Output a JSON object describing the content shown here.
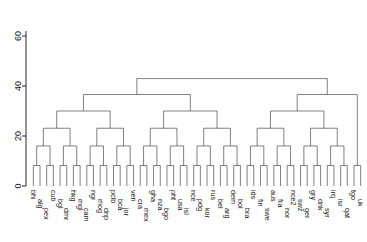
{
  "chart_data": {
    "type": "dendrogram",
    "title": "",
    "xlabel": "",
    "ylabel": "",
    "ylim": [
      0,
      68
    ],
    "yticks": [
      0,
      20,
      40,
      60
    ],
    "ytick_labels": [
      "0",
      "20",
      "40",
      "60"
    ],
    "grid": false,
    "legend": false,
    "orientation": "vertical",
    "leaf_label_rotation": 90,
    "n_leaves": 50,
    "leaves": [
      "bhi",
      "alg",
      "pex",
      "cub",
      "bgl",
      "dmr",
      "hkg",
      "mgl",
      "cam",
      "ngr",
      "mog",
      "dnp",
      "pclb",
      "bca",
      "jor",
      "ven",
      "cra",
      "mex",
      "gha",
      "nza",
      "bgo",
      "pht",
      "usa",
      "isl",
      "nce",
      "pdg",
      "kor",
      "rus",
      "bel",
      "arg",
      "dem",
      "bol",
      "bra",
      "ids",
      "fin",
      "swe",
      "aus",
      "fra",
      "nor",
      "nce2",
      "swz",
      "ger",
      "gry",
      "dnk",
      "syr",
      "irq",
      "isr",
      "qat",
      "tgo",
      "uk"
    ],
    "merge_heights": [
      8,
      12,
      14,
      17,
      19,
      21,
      23,
      25,
      27,
      29,
      31,
      33,
      36,
      38,
      41,
      44,
      47,
      50,
      53,
      56,
      59,
      62,
      65,
      68
    ],
    "root_height": 68
  },
  "axis": {
    "ticks": [
      {
        "label": "60",
        "value": 60
      },
      {
        "label": "40",
        "value": 40
      },
      {
        "label": "20",
        "value": 20
      },
      {
        "label": "0",
        "value": 0
      }
    ]
  },
  "colors": {
    "background": "#ffffff",
    "branch": "#4a4a4a",
    "axis": "#111111",
    "text": "#111111"
  }
}
